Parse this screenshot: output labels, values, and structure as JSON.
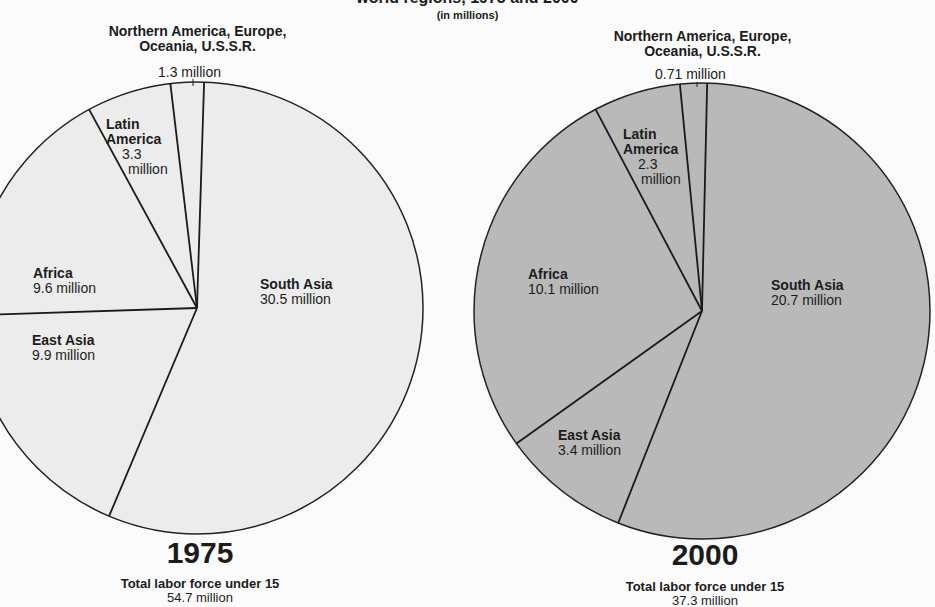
{
  "header": {
    "title": "world regions, 1975 and 2000",
    "subtitle": "(in millions)"
  },
  "pies": [
    {
      "year": "1975",
      "footer_label": "Total labor force under 15",
      "footer_value": "54.7 million",
      "fill": "#ececec",
      "top_label": "Northern America, Europe, Oceania, U.S.S.R.",
      "top_label_line1": "Northern America, Europe,",
      "top_label_line2": "Oceania, U.S.S.R.",
      "top_value": "1.3 million",
      "labels": {
        "latin_america_name1": "Latin",
        "latin_america_name2": "America",
        "latin_america_value1": "3.3",
        "latin_america_value2": "million",
        "africa_name": "Africa",
        "africa_value": "9.6 million",
        "east_asia_name": "East Asia",
        "east_asia_value": "9.9 million",
        "south_asia_name": "South Asia",
        "south_asia_value": "30.5 million"
      }
    },
    {
      "year": "2000",
      "footer_label": "Total labor force under 15",
      "footer_value": "37.3 million",
      "fill": "#b9b9b9",
      "top_label": "Northern America, Europe, Oceania, U.S.S.R.",
      "top_label_line1": "Northern America, Europe,",
      "top_label_line2": "Oceania, U.S.S.R.",
      "top_value": "0.71 million",
      "labels": {
        "latin_america_name1": "Latin",
        "latin_america_name2": "America",
        "latin_america_value1": "2.3",
        "latin_america_value2": "million",
        "africa_name": "Africa",
        "africa_value": "10.1 million",
        "east_asia_name": "East Asia",
        "east_asia_value": "3.4 million",
        "south_asia_name": "South Asia",
        "south_asia_value": "20.7 million"
      }
    }
  ],
  "chart_data": [
    {
      "type": "pie",
      "title": "Labor force under 15, world regions, 1975",
      "subtitle": "(in millions)",
      "categories": [
        "South Asia",
        "East Asia",
        "Africa",
        "Latin America",
        "Northern America, Europe, Oceania, U.S.S.R."
      ],
      "values": [
        30.5,
        9.9,
        9.6,
        3.3,
        1.3
      ],
      "unit": "million",
      "total": 54.7,
      "total_label": "Total labor force under 15"
    },
    {
      "type": "pie",
      "title": "Labor force under 15, world regions, 2000",
      "subtitle": "(in millions)",
      "categories": [
        "South Asia",
        "East Asia",
        "Africa",
        "Latin America",
        "Northern America, Europe, Oceania, U.S.S.R."
      ],
      "values": [
        20.7,
        3.4,
        10.1,
        2.3,
        0.71
      ],
      "unit": "million",
      "total": 37.3,
      "total_label": "Total labor force under 15"
    }
  ]
}
